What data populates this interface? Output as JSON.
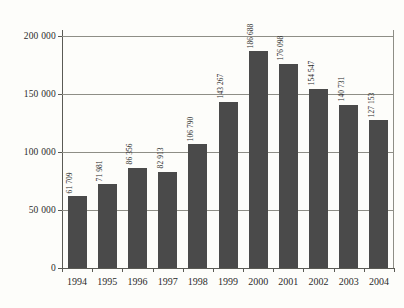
{
  "chart_data": {
    "type": "bar",
    "title": "",
    "subtitle": "",
    "xlabel": "",
    "ylabel": "",
    "categories": [
      "1994",
      "1995",
      "1996",
      "1997",
      "1998",
      "1999",
      "2000",
      "2001",
      "2002",
      "2003",
      "2004"
    ],
    "values": [
      61709,
      71981,
      86356,
      82913,
      106790,
      143267,
      186688,
      176098,
      154547,
      140731,
      127153
    ],
    "value_labels": [
      "61 709",
      "71 981",
      "86 356",
      "82 913",
      "106 790",
      "143 267",
      "186 688",
      "176 098",
      "154 547",
      "140 731",
      "127 153"
    ],
    "ylim": [
      0,
      205000
    ],
    "yticks": [
      0,
      50000,
      100000,
      150000,
      200000
    ],
    "ytick_labels": [
      "0",
      "50 000",
      "100 000",
      "150 000",
      "200 000"
    ],
    "grid": true,
    "legend": null,
    "legend_position": "none",
    "series": [
      {
        "name": "",
        "values": [
          61709,
          71981,
          86356,
          82913,
          106790,
          143267,
          186688,
          176098,
          154547,
          140731,
          127153
        ]
      }
    ],
    "colors": {
      "bar": "#4a4a4a",
      "background": "#fdfdfa",
      "grid": "#8e8e86",
      "axis": "#5a5a54",
      "text": "#2b2b2b"
    }
  }
}
